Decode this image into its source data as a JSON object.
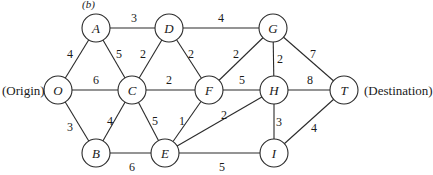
{
  "figure_label": "(b)",
  "side_labels": {
    "origin": "(Origin)",
    "destination": "(Destination)"
  },
  "nodes": [
    {
      "id": "O",
      "label": "O",
      "x": 58,
      "y": 90
    },
    {
      "id": "A",
      "label": "A",
      "x": 96,
      "y": 28
    },
    {
      "id": "B",
      "label": "B",
      "x": 96,
      "y": 153
    },
    {
      "id": "C",
      "label": "C",
      "x": 132,
      "y": 90
    },
    {
      "id": "D",
      "label": "D",
      "x": 169,
      "y": 28
    },
    {
      "id": "E",
      "label": "E",
      "x": 165,
      "y": 153
    },
    {
      "id": "F",
      "label": "F",
      "x": 209,
      "y": 90
    },
    {
      "id": "G",
      "label": "G",
      "x": 273,
      "y": 28
    },
    {
      "id": "H",
      "label": "H",
      "x": 274,
      "y": 90
    },
    {
      "id": "I",
      "label": "I",
      "x": 274,
      "y": 153
    },
    {
      "id": "T",
      "label": "T",
      "x": 344,
      "y": 90
    }
  ],
  "edges": [
    {
      "from": "O",
      "to": "A",
      "weight": "4",
      "lx": 70,
      "ly": 58
    },
    {
      "from": "O",
      "to": "C",
      "weight": "6",
      "lx": 96,
      "ly": 84
    },
    {
      "from": "O",
      "to": "B",
      "weight": "3",
      "lx": 70,
      "ly": 131
    },
    {
      "from": "A",
      "to": "D",
      "weight": "3",
      "lx": 134,
      "ly": 22
    },
    {
      "from": "A",
      "to": "C",
      "weight": "5",
      "lx": 119,
      "ly": 58
    },
    {
      "from": "C",
      "to": "D",
      "weight": "2",
      "lx": 143,
      "ly": 58
    },
    {
      "from": "D",
      "to": "F",
      "weight": "2",
      "lx": 191,
      "ly": 58
    },
    {
      "from": "D",
      "to": "G",
      "weight": "4",
      "lx": 221,
      "ly": 22
    },
    {
      "from": "C",
      "to": "F",
      "weight": "2",
      "lx": 169,
      "ly": 84
    },
    {
      "from": "C",
      "to": "B",
      "weight": "4",
      "lx": 110,
      "ly": 125
    },
    {
      "from": "C",
      "to": "E",
      "weight": "5",
      "lx": 155,
      "ly": 125
    },
    {
      "from": "B",
      "to": "E",
      "weight": "6",
      "lx": 132,
      "ly": 171
    },
    {
      "from": "F",
      "to": "E",
      "weight": "1",
      "lx": 182,
      "ly": 125
    },
    {
      "from": "F",
      "to": "G",
      "weight": "2",
      "lx": 236,
      "ly": 58
    },
    {
      "from": "F",
      "to": "H",
      "weight": "5",
      "lx": 242,
      "ly": 84
    },
    {
      "from": "G",
      "to": "H",
      "weight": "2",
      "lx": 280,
      "ly": 63
    },
    {
      "from": "G",
      "to": "T",
      "weight": "7",
      "lx": 313,
      "ly": 58
    },
    {
      "from": "H",
      "to": "T",
      "weight": "8",
      "lx": 310,
      "ly": 84
    },
    {
      "from": "E",
      "to": "H",
      "weight": "2",
      "lx": 224,
      "ly": 119
    },
    {
      "from": "E",
      "to": "I",
      "weight": "5",
      "lx": 222,
      "ly": 171
    },
    {
      "from": "H",
      "to": "I",
      "weight": "3",
      "lx": 279,
      "ly": 126
    },
    {
      "from": "I",
      "to": "T",
      "weight": "4",
      "lx": 314,
      "ly": 132
    }
  ]
}
